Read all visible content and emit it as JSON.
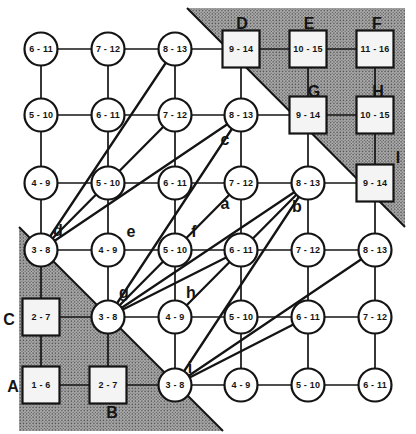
{
  "figure": {
    "type": "grid-graph-diagram",
    "canvas": {
      "width": 416,
      "height": 434,
      "background": "#ffffff"
    },
    "colors": {
      "ink": "#141414",
      "node_fill": "#ffffff",
      "square_fill": "#f4f4f4",
      "shade_base": "#b2b2b2",
      "shade_dot": "#4e4e4e"
    },
    "grid": {
      "cols_x": [
        41,
        108,
        175,
        241,
        308,
        375
      ],
      "rows_y": [
        49,
        115,
        183,
        250,
        317,
        385
      ],
      "circle_radius": 16.5,
      "square_size": 37
    },
    "shaded_regions": [
      {
        "name": "top-right-triangle",
        "points": "187,8 405,8 405,227",
        "hypotenuse": {
          "x1": 187,
          "y1": 8,
          "x2": 405,
          "y2": 227
        }
      },
      {
        "name": "bottom-left-triangle",
        "points": "19,227 223,431 19,431",
        "hypotenuse": {
          "x1": 19,
          "y1": 227,
          "x2": 223,
          "y2": 431
        }
      }
    ],
    "nodes": [
      {
        "id": "r1c1",
        "row": 1,
        "col": 1,
        "shape": "circle",
        "label": "6 - 11"
      },
      {
        "id": "r1c2",
        "row": 1,
        "col": 2,
        "shape": "circle",
        "label": "7 - 12"
      },
      {
        "id": "r1c3",
        "row": 1,
        "col": 3,
        "shape": "circle",
        "label": "8 - 13"
      },
      {
        "id": "r1c4",
        "row": 1,
        "col": 4,
        "shape": "square",
        "label": "9 - 14"
      },
      {
        "id": "r1c5",
        "row": 1,
        "col": 5,
        "shape": "square",
        "label": "10 - 15"
      },
      {
        "id": "r1c6",
        "row": 1,
        "col": 6,
        "shape": "square",
        "label": "11 - 16"
      },
      {
        "id": "r2c1",
        "row": 2,
        "col": 1,
        "shape": "circle",
        "label": "5 - 10"
      },
      {
        "id": "r2c2",
        "row": 2,
        "col": 2,
        "shape": "circle",
        "label": "6 - 11"
      },
      {
        "id": "r2c3",
        "row": 2,
        "col": 3,
        "shape": "circle",
        "label": "7 - 12"
      },
      {
        "id": "r2c4",
        "row": 2,
        "col": 4,
        "shape": "circle",
        "label": "8 - 13"
      },
      {
        "id": "r2c5",
        "row": 2,
        "col": 5,
        "shape": "square",
        "label": "9 - 14"
      },
      {
        "id": "r2c6",
        "row": 2,
        "col": 6,
        "shape": "square",
        "label": "10 - 15"
      },
      {
        "id": "r3c1",
        "row": 3,
        "col": 1,
        "shape": "circle",
        "label": "4 - 9"
      },
      {
        "id": "r3c2",
        "row": 3,
        "col": 2,
        "shape": "circle",
        "label": "5 - 10"
      },
      {
        "id": "r3c3",
        "row": 3,
        "col": 3,
        "shape": "circle",
        "label": "6 - 11"
      },
      {
        "id": "r3c4",
        "row": 3,
        "col": 4,
        "shape": "circle",
        "label": "7 - 12"
      },
      {
        "id": "r3c5",
        "row": 3,
        "col": 5,
        "shape": "circle",
        "label": "8 - 13"
      },
      {
        "id": "r3c6",
        "row": 3,
        "col": 6,
        "shape": "square",
        "label": "9 - 14"
      },
      {
        "id": "r4c1",
        "row": 4,
        "col": 1,
        "shape": "circle",
        "label": "3 - 8"
      },
      {
        "id": "r4c2",
        "row": 4,
        "col": 2,
        "shape": "circle",
        "label": "4 - 9"
      },
      {
        "id": "r4c3",
        "row": 4,
        "col": 3,
        "shape": "circle",
        "label": "5 - 10"
      },
      {
        "id": "r4c4",
        "row": 4,
        "col": 4,
        "shape": "circle",
        "label": "6 - 11"
      },
      {
        "id": "r4c5",
        "row": 4,
        "col": 5,
        "shape": "circle",
        "label": "7 - 12"
      },
      {
        "id": "r4c6",
        "row": 4,
        "col": 6,
        "shape": "circle",
        "label": "8 - 13"
      },
      {
        "id": "r5c1",
        "row": 5,
        "col": 1,
        "shape": "square",
        "label": "2 - 7"
      },
      {
        "id": "r5c2",
        "row": 5,
        "col": 2,
        "shape": "circle",
        "label": "3 - 8"
      },
      {
        "id": "r5c3",
        "row": 5,
        "col": 3,
        "shape": "circle",
        "label": "4 - 9"
      },
      {
        "id": "r5c4",
        "row": 5,
        "col": 4,
        "shape": "circle",
        "label": "5 - 10"
      },
      {
        "id": "r5c5",
        "row": 5,
        "col": 5,
        "shape": "circle",
        "label": "6 - 11"
      },
      {
        "id": "r5c6",
        "row": 5,
        "col": 6,
        "shape": "circle",
        "label": "7 - 12"
      },
      {
        "id": "r6c1",
        "row": 6,
        "col": 1,
        "shape": "square",
        "label": "1 - 6"
      },
      {
        "id": "r6c2",
        "row": 6,
        "col": 2,
        "shape": "square",
        "label": "2 - 7"
      },
      {
        "id": "r6c3",
        "row": 6,
        "col": 3,
        "shape": "circle",
        "label": "3 - 8"
      },
      {
        "id": "r6c4",
        "row": 6,
        "col": 4,
        "shape": "circle",
        "label": "4 - 9"
      },
      {
        "id": "r6c5",
        "row": 6,
        "col": 5,
        "shape": "circle",
        "label": "5 - 10"
      },
      {
        "id": "r6c6",
        "row": 6,
        "col": 6,
        "shape": "circle",
        "label": "6 - 11"
      }
    ],
    "diagonal_edges": [
      [
        "r1c3",
        "r4c1"
      ],
      [
        "r2c4",
        "r5c2"
      ],
      [
        "r3c5",
        "r6c3"
      ],
      [
        "r2c4",
        "r4c1"
      ],
      [
        "r3c5",
        "r5c2"
      ],
      [
        "r4c6",
        "r6c3"
      ],
      [
        "r4c4",
        "r5c2"
      ],
      [
        "r5c5",
        "r6c3"
      ],
      [
        "r4c1",
        "r2c3"
      ],
      [
        "r5c2",
        "r3c4"
      ],
      [
        "r5c3",
        "r3c5"
      ]
    ],
    "letters": [
      {
        "text": "D",
        "x": 242,
        "y": 23
      },
      {
        "text": "E",
        "x": 309,
        "y": 23
      },
      {
        "text": "F",
        "x": 377,
        "y": 23
      },
      {
        "text": "G",
        "x": 314,
        "y": 91
      },
      {
        "text": "H",
        "x": 378,
        "y": 91
      },
      {
        "text": "I",
        "x": 398,
        "y": 157
      },
      {
        "text": "C",
        "x": 9,
        "y": 319
      },
      {
        "text": "A",
        "x": 13,
        "y": 386
      },
      {
        "text": "B",
        "x": 112,
        "y": 412
      },
      {
        "text": "c",
        "x": 225,
        "y": 139
      },
      {
        "text": "a",
        "x": 225,
        "y": 203
      },
      {
        "text": "b",
        "x": 297,
        "y": 206
      },
      {
        "text": "d",
        "x": 58,
        "y": 230
      },
      {
        "text": "e",
        "x": 131,
        "y": 231
      },
      {
        "text": "f",
        "x": 194,
        "y": 231
      },
      {
        "text": "g",
        "x": 124,
        "y": 292
      },
      {
        "text": "h",
        "x": 191,
        "y": 292
      },
      {
        "text": "i",
        "x": 190,
        "y": 367
      }
    ]
  }
}
